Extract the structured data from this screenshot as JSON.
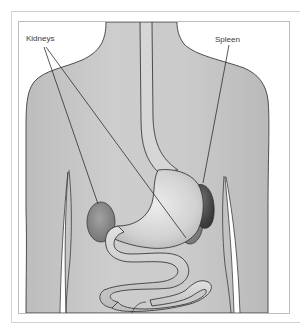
{
  "figure": {
    "type": "anatomical-illustration",
    "labels": [
      {
        "id": "kidneys",
        "text": "Kidneys",
        "x": 26,
        "y": 34
      },
      {
        "id": "spleen",
        "text": "Spleen",
        "x": 215,
        "y": 35
      }
    ],
    "colors": {
      "frame_border": "#bdbdbd",
      "skin": "#c9c9c9",
      "outline": "#3c3c3c",
      "stomach": "#d8d8d8",
      "kidney": "#8a8a8a",
      "spleen": "#4a4a4a",
      "intestine": "#cfcfcf",
      "leader_line": "#2e2e2e"
    }
  }
}
